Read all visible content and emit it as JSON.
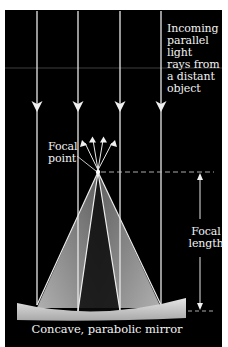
{
  "diagram": {
    "colors": {
      "background": "#000000",
      "page": "#ffffff",
      "ray": "#e8e8e8",
      "text": "#f2f2f2",
      "cone_light": "#9a9a9a",
      "mirror": "#d0d0d0"
    },
    "labels": {
      "incoming": {
        "lines": [
          "Incoming",
          "parallel",
          "light",
          "rays from",
          "a distant",
          "object"
        ]
      },
      "focal_point": {
        "lines": [
          "Focal",
          "point"
        ]
      },
      "focal_length": {
        "lines": [
          "Focal",
          "length"
        ]
      },
      "mirror": "Concave, parabolic mirror"
    },
    "incoming_rays": [
      {
        "x": 37
      },
      {
        "x": 78
      },
      {
        "x": 120
      },
      {
        "x": 161
      }
    ],
    "focal_point": {
      "x": 98,
      "y": 172
    },
    "reflected_arrows": 4,
    "icons": {
      "ray_arrow": "down-arrow-icon",
      "reflected_arrow": "up-arrow-icon",
      "dimension_arrow": "double-arrow-icon"
    }
  }
}
